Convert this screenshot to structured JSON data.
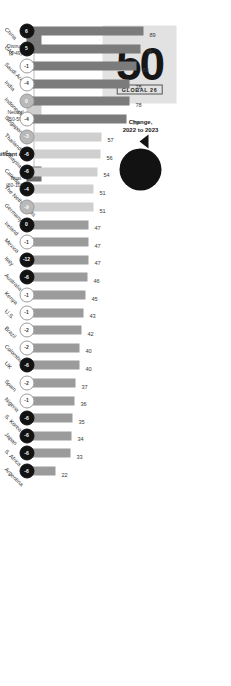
{
  "header": {
    "title": "MULTI-CURRENCY MERCANTILE"
  },
  "global": {
    "value": "50",
    "tag": "GLOBAL 26"
  },
  "change": {
    "value": "-1",
    "unit": "pt",
    "label_line1": "Change,",
    "label_line2": "2022 to 2023"
  },
  "legend": {
    "bands": [
      {
        "name": "Distrust",
        "range": "(1-49)",
        "color": "#7b7b7b"
      },
      {
        "name": "Neutral",
        "range": "(50-59)",
        "color": "#cfcfcf"
      },
      {
        "name": "Trust",
        "range": "(60-100)",
        "color": "#6f6f6f"
      }
    ],
    "markers_label": "Significant change",
    "markers": [
      {
        "name": "significant-increase",
        "fill": "#121212",
        "border": "#121212",
        "text": "#ffffff"
      },
      {
        "name": "moderate-change",
        "fill": "#b9b9b9",
        "border": "#8f8f8f",
        "text": "#ffffff"
      },
      {
        "name": "no-change",
        "fill": "#ffffff",
        "border": "#9d9d9d",
        "text": "#2b2b2b"
      }
    ]
  },
  "chart_data": {
    "type": "bar",
    "title": "MULTI-CURRENCY MERCANTILE",
    "xlabel": "",
    "ylabel": "Trust Index",
    "ylim": [
      0,
      100
    ],
    "grid": false,
    "legend_position": "top-right",
    "categories": [
      "China",
      "UAE",
      "Saudi Arabia",
      "India",
      "Indonesia",
      "Singapore",
      "Thailand",
      "Malaysia",
      "Canada",
      "The Netherlands",
      "Germany",
      "Ireland",
      "Mexico",
      "Italy",
      "Australia",
      "Kenya",
      "U.S.",
      "Brazil",
      "Colombia",
      "UK",
      "Spain",
      "Nigeria",
      "S. Korea",
      "Japan",
      "S. Africa",
      "Argentina"
    ],
    "values": [
      89,
      86,
      83,
      78,
      78,
      76,
      57,
      56,
      54,
      51,
      51,
      47,
      47,
      47,
      46,
      45,
      43,
      42,
      40,
      40,
      37,
      36,
      35,
      34,
      33,
      22
    ],
    "changes": [
      "6",
      "5",
      "-1",
      "-4",
      "0",
      "-4",
      "-3",
      "-6",
      "-6",
      "-4",
      "-9",
      "0",
      "-1",
      "-12",
      "-6",
      "-1",
      "-1",
      "-2",
      "-2",
      "-6",
      "-2",
      "-1",
      "-6",
      "-6",
      "-6",
      "-6"
    ],
    "bands": [
      "trust",
      "trust",
      "trust",
      "trust",
      "trust",
      "trust",
      "neutral",
      "neutral",
      "neutral",
      "neutral",
      "neutral",
      "distrust",
      "distrust",
      "distrust",
      "distrust",
      "distrust",
      "distrust",
      "distrust",
      "distrust",
      "distrust",
      "distrust",
      "distrust",
      "distrust",
      "distrust",
      "distrust",
      "distrust"
    ],
    "marker_kinds": [
      "sig",
      "sig",
      "none",
      "none",
      "mod",
      "none",
      "mod",
      "sig",
      "sig",
      "sig",
      "mod",
      "sig",
      "none",
      "sig",
      "sig",
      "none",
      "none",
      "none",
      "none",
      "sig",
      "none",
      "none",
      "sig",
      "sig",
      "sig",
      "sig"
    ]
  }
}
